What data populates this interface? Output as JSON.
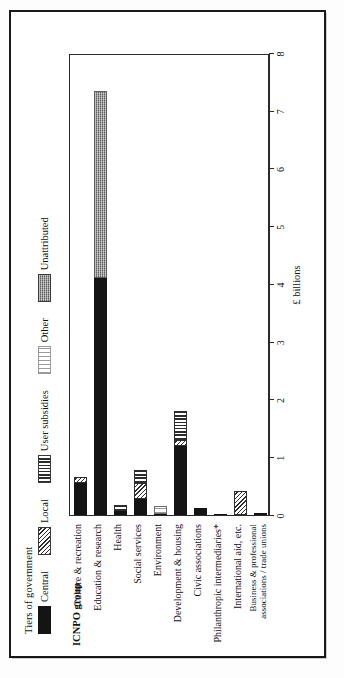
{
  "figure": {
    "category_axis_title": "ICNPO group",
    "legend_title": "Tiers of government"
  },
  "chart_data": {
    "type": "bar",
    "orientation": "horizontal",
    "stacked": true,
    "title": "",
    "xlabel": "£ billions",
    "ylabel": "ICNPO group",
    "xlim": [
      0,
      8
    ],
    "xticks": [
      "0",
      "1",
      "2",
      "3",
      "4",
      "5",
      "6",
      "7",
      "8"
    ],
    "grid": false,
    "legend_position": "top-left",
    "legend_title": "Tiers of government",
    "series": [
      {
        "name": "Central",
        "key": "central",
        "swatch": "black-solid",
        "color": "#141414"
      },
      {
        "name": "Local",
        "key": "local",
        "swatch": "diagonal-hatch",
        "color": "#2e2e2e"
      },
      {
        "name": "User subsidies",
        "key": "user_subsidies",
        "swatch": "vertical-stripes",
        "color": "#2b2b2b"
      },
      {
        "name": "Other",
        "key": "other",
        "swatch": "light-dots",
        "color": "#9a9a9a"
      },
      {
        "name": "Unattributed",
        "key": "unattributed",
        "swatch": "dark-stipple",
        "color": "#8c8c8c"
      }
    ],
    "categories": [
      "Culture & recreation",
      "Education & research",
      "Health",
      "Social services",
      "Environment",
      "Development & housing",
      "Civic associations",
      "Philanthropic intermediaries*",
      "International aid, etc.",
      "Business & professional associations / trade unions"
    ],
    "rows": [
      {
        "category": "Culture & recreation",
        "central": 0.55,
        "local": 0.1,
        "user_subsidies": 0.0,
        "other": 0.0,
        "unattributed": 0.0,
        "total": 0.65
      },
      {
        "category": "Education & research",
        "central": 4.1,
        "local": 0.0,
        "user_subsidies": 0.0,
        "other": 0.0,
        "unattributed": 3.25,
        "total": 7.35
      },
      {
        "category": "Health",
        "central": 0.07,
        "local": 0.0,
        "user_subsidies": 0.1,
        "other": 0.0,
        "unattributed": 0.0,
        "total": 0.17
      },
      {
        "category": "Social services",
        "central": 0.28,
        "local": 0.28,
        "user_subsidies": 0.22,
        "other": 0.0,
        "unattributed": 0.0,
        "total": 0.78
      },
      {
        "category": "Environment",
        "central": 0.02,
        "local": 0.0,
        "user_subsidies": 0.0,
        "other": 0.13,
        "unattributed": 0.0,
        "total": 0.15
      },
      {
        "category": "Development & housing",
        "central": 1.2,
        "local": 0.1,
        "user_subsidies": 0.5,
        "other": 0.0,
        "unattributed": 0.0,
        "total": 1.8
      },
      {
        "category": "Civic associations",
        "central": 0.12,
        "local": 0.0,
        "user_subsidies": 0.0,
        "other": 0.0,
        "unattributed": 0.0,
        "total": 0.12
      },
      {
        "category": "Philanthropic intermediaries*",
        "central": 0.02,
        "local": 0.0,
        "user_subsidies": 0.0,
        "other": 0.0,
        "unattributed": 0.0,
        "total": 0.02
      },
      {
        "category": "International aid, etc.",
        "central": 0.0,
        "local": 0.42,
        "user_subsidies": 0.0,
        "other": 0.0,
        "unattributed": 0.0,
        "total": 0.42
      },
      {
        "category": "Business & professional associations / trade unions",
        "central": 0.03,
        "local": 0.0,
        "user_subsidies": 0.0,
        "other": 0.0,
        "unattributed": 0.0,
        "total": 0.03
      }
    ]
  }
}
